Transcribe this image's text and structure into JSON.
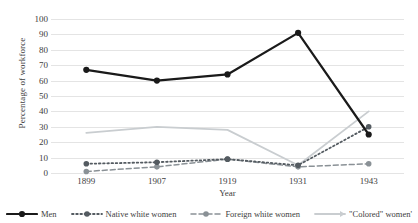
{
  "chart_data": {
    "type": "line",
    "title": "",
    "xlabel": "Year",
    "ylabel": "Percentage of workforce",
    "categories": [
      "1899",
      "1907",
      "1919",
      "1931",
      "1943"
    ],
    "x_tick_labels": [
      "1899",
      "1907",
      "1919",
      "1931",
      "1943"
    ],
    "y_tick_labels": [
      "100",
      "90",
      "80",
      "70",
      "60",
      "50",
      "40",
      "30",
      "20",
      "10",
      "0"
    ],
    "ylim": [
      0,
      100
    ],
    "y_ticks": [
      0,
      10,
      20,
      30,
      40,
      50,
      60,
      70,
      80,
      90,
      100
    ],
    "grid": "horizontal",
    "legend_position": "bottom",
    "series": [
      {
        "name": "Men",
        "values": [
          67,
          60,
          64,
          91,
          25
        ],
        "color": "#1a1a1a",
        "style": "solid",
        "marker": "circle"
      },
      {
        "name": "Native white women",
        "values": [
          6,
          7,
          9,
          5,
          30
        ],
        "color": "#545b61",
        "style": "dotted",
        "marker": "circle"
      },
      {
        "name": "Foreign white women",
        "values": [
          1,
          4,
          9,
          4,
          6
        ],
        "color": "#8a9196",
        "style": "dashed",
        "marker": "circle"
      },
      {
        "name": "\"Colored\" women'",
        "values": [
          26,
          30,
          28,
          5,
          40
        ],
        "color": "#c9cdd0",
        "style": "solid-light",
        "marker": "none"
      }
    ]
  },
  "legend": {
    "items": [
      {
        "label": "Men"
      },
      {
        "label": "Native white women"
      },
      {
        "label": "Foreign white women"
      },
      {
        "label": "\"Colored\" women'"
      }
    ]
  },
  "colors": {
    "men": "#1a1a1a",
    "native_white_women": "#545b61",
    "foreign_white_women": "#8a9196",
    "colored_women": "#c9cdd0",
    "gridline": "#e4e4e4",
    "text": "#404040"
  }
}
